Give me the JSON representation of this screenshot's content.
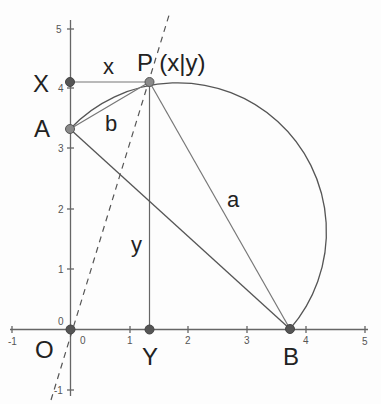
{
  "diagram": {
    "type": "geometry-construction",
    "colors": {
      "axis": "#666666",
      "line": "#666666",
      "arc": "#555555",
      "point_fill": "#8a8a8a",
      "point_fill_dark": "#555555",
      "text": "#222222"
    },
    "axes": {
      "x_ticks": [
        {
          "value": -1,
          "label": "-1"
        },
        {
          "value": 0,
          "label": "0"
        },
        {
          "value": 1,
          "label": "1"
        },
        {
          "value": 2,
          "label": "2"
        },
        {
          "value": 3,
          "label": "3"
        },
        {
          "value": 4,
          "label": "4"
        },
        {
          "value": 5,
          "label": "5"
        }
      ],
      "y_ticks": [
        {
          "value": -1,
          "label": "-1"
        },
        {
          "value": 0,
          "label": "0"
        },
        {
          "value": 1,
          "label": "1"
        },
        {
          "value": 2,
          "label": "2"
        },
        {
          "value": 3,
          "label": "3"
        },
        {
          "value": 4,
          "label": "4"
        },
        {
          "value": 5,
          "label": "5"
        }
      ],
      "xlim": [
        -1,
        5
      ],
      "ylim": [
        -1,
        5
      ]
    },
    "points": {
      "O": {
        "label": "O",
        "x": 0,
        "y": 0
      },
      "X": {
        "label": "X",
        "x": 0,
        "y": 4.1
      },
      "A": {
        "label": "A",
        "x": 0,
        "y": 3.3
      },
      "P": {
        "label": "P (x|y)",
        "x": 1.33,
        "y": 4.1
      },
      "Y": {
        "label": "Y",
        "x": 1.33,
        "y": 0
      },
      "B": {
        "label": "B",
        "x": 3.73,
        "y": 0
      }
    },
    "segment_labels": {
      "x": "x",
      "y": "y",
      "a": "a",
      "b": "b"
    }
  }
}
